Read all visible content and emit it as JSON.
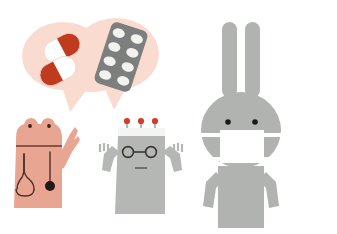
{
  "canvas": {
    "width": 337,
    "height": 234,
    "background": "#ffffff",
    "title": "Medical illustration: speech bubble with medicine, frog doctor, robot and masked rabbit"
  },
  "palette": {
    "background": "#ffffff",
    "bubble_pink": "#fadbd0",
    "frog_pink": "#e8a591",
    "frog_outline": "#6b3b30",
    "capsule_red": "#c03a20",
    "capsule_white": "#ffffff",
    "blister_gray": "#7c7f7e",
    "pill_white": "#f2f2ef",
    "robot_gray": "#b5b7b4",
    "robot_head_band": "#f4f4f2",
    "antenna_red": "#d83a28",
    "dark_ink": "#3a3633",
    "rabbit_gray": "#b0b3b0",
    "mask_white": "#ffffff",
    "eye_black": "#1c1a18"
  },
  "scene": {
    "speech_bubble": {
      "label": "Speech bubble with medicine",
      "fill": "#fadbd0",
      "tail_count": 2,
      "contents": [
        {
          "name": "capsule-upper",
          "type": "capsule",
          "red_half": "#c03a20",
          "white_half": "#ffffff",
          "rotation_deg": -28
        },
        {
          "name": "capsule-lower",
          "type": "capsule",
          "red_half": "#c03a20",
          "white_half": "#ffffff",
          "rotation_deg": -28
        },
        {
          "name": "blister-pack",
          "type": "blister",
          "pack_fill": "#7c7f7e",
          "pill_fill": "#f2f2ef",
          "rows": 4,
          "columns": 2,
          "pill_count": 8,
          "rotation_deg": 18
        }
      ]
    },
    "characters": [
      {
        "name": "frog-doctor",
        "label": "Frog doctor with stethoscope",
        "body_fill": "#e8a591",
        "line_color": "#6b3b30",
        "eye_color": "#3a2520",
        "eye_count": 2,
        "accessories": [
          "stethoscope",
          "raised-pointing-arm"
        ],
        "head_shape": "two-bump-frog-head"
      },
      {
        "name": "robot",
        "label": "Robot with glasses and three antennas",
        "body_fill": "#b5b7b4",
        "head_band_fill": "#f4f4f2",
        "antenna_color": "#d83a28",
        "antenna_count": 3,
        "line_color": "#3a3633",
        "accessories": [
          "round-glasses",
          "raised-arms",
          "mouth-line"
        ],
        "hand_finger_count": 3
      },
      {
        "name": "rabbit",
        "label": "Rabbit wearing a face mask",
        "body_fill": "#b0b3b0",
        "mask_fill": "#ffffff",
        "eye_color": "#1c1a18",
        "eye_count": 2,
        "ear_count": 2,
        "accessories": [
          "face-mask",
          "long-ears",
          "two-arms"
        ]
      }
    ]
  }
}
